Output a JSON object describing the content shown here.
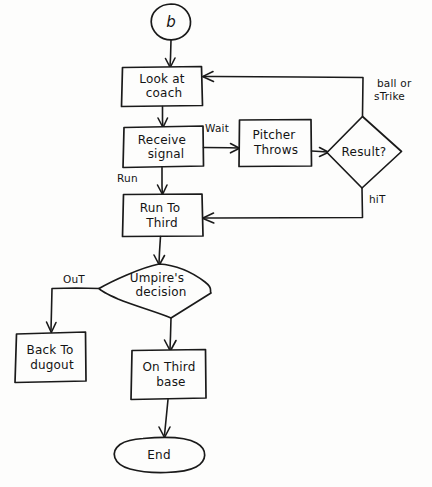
{
  "diagram": {
    "style": "hand-drawn",
    "ink_color": "#1a1a1a",
    "background_color": "#fdfdfc"
  },
  "nodes": {
    "start": {
      "type": "connector",
      "label": "b"
    },
    "look_at_coach": {
      "type": "process",
      "line1": "Look at",
      "line2": "coach"
    },
    "receive_signal": {
      "type": "process",
      "line1": "Receive",
      "line2": "signal"
    },
    "pitcher_throws": {
      "type": "process",
      "line1": "Pitcher",
      "line2": "Throws"
    },
    "result": {
      "type": "decision",
      "label": "Result?"
    },
    "run_to_third": {
      "type": "process",
      "line1": "Run To",
      "line2": "Third"
    },
    "umpires_decision": {
      "type": "decision",
      "line1": "Umpire's",
      "line2": "decision"
    },
    "back_to_dugout": {
      "type": "process",
      "line1": "Back To",
      "line2": "dugout"
    },
    "on_third_base": {
      "type": "process",
      "line1": "On Third",
      "line2": "base"
    },
    "end": {
      "type": "terminator",
      "label": "End"
    }
  },
  "edge_labels": {
    "wait": "Wait",
    "run": "Run",
    "ball_or_strike_line1": "ball or",
    "ball_or_strike_line2": "sTrike",
    "hit": "hiT",
    "out": "OuT"
  },
  "flow": [
    {
      "from": "start",
      "to": "look_at_coach",
      "label": ""
    },
    {
      "from": "look_at_coach",
      "to": "receive_signal",
      "label": ""
    },
    {
      "from": "receive_signal",
      "to": "pitcher_throws",
      "label": "Wait"
    },
    {
      "from": "receive_signal",
      "to": "run_to_third",
      "label": "Run"
    },
    {
      "from": "pitcher_throws",
      "to": "result",
      "label": ""
    },
    {
      "from": "result",
      "to": "look_at_coach",
      "label": "ball or sTrike"
    },
    {
      "from": "result",
      "to": "run_to_third",
      "label": "hiT"
    },
    {
      "from": "run_to_third",
      "to": "umpires_decision",
      "label": ""
    },
    {
      "from": "umpires_decision",
      "to": "back_to_dugout",
      "label": "OuT"
    },
    {
      "from": "umpires_decision",
      "to": "on_third_base",
      "label": ""
    },
    {
      "from": "on_third_base",
      "to": "end",
      "label": ""
    }
  ]
}
